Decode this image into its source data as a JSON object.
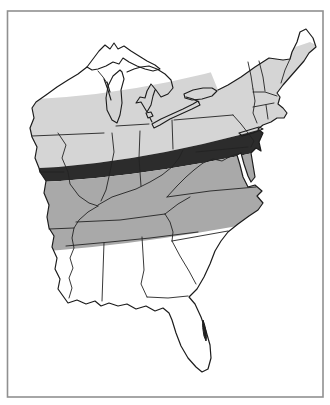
{
  "figure": {
    "type": "map",
    "name": "eastern-united-states-shaded-band-map",
    "visible_text": "",
    "bands": [
      {
        "id": "north-light-band",
        "shade": "light-gray",
        "extent": "Great Lakes through New England"
      },
      {
        "id": "central-dark-band",
        "shade": "near-black",
        "extent": "Iowa-Missouri border to New Jersey coast"
      },
      {
        "id": "south-medium-band",
        "shade": "medium-gray",
        "extent": "Missouri-Arkansas through the Carolinas"
      }
    ]
  },
  "colors": {
    "page_background": "#ffffff",
    "map_background": "#ffffff",
    "frame": "#909090",
    "coastline": "#1c1c1c",
    "state_line": "#232323",
    "lake_line": "#1c1c1c",
    "band_light": "#d5d5d5",
    "band_dark": "#2c2c2c",
    "band_medium": "#a9a9a9",
    "florida_mark": "#222222"
  }
}
